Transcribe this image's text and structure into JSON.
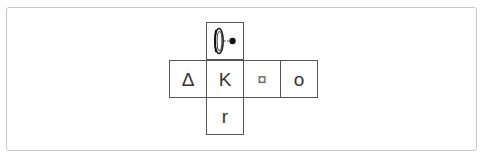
{
  "diagram": {
    "type": "cube-net",
    "cell_size_px": 38,
    "colors": {
      "frame_border": "#c8c8c8",
      "cell_border": "#555555",
      "glyph": "#333333"
    },
    "cells": [
      {
        "id": "top",
        "row": 0,
        "col": 1,
        "kind": "icon",
        "icon": "ring-with-dot-icon",
        "label": ""
      },
      {
        "id": "left",
        "row": 1,
        "col": 0,
        "kind": "text",
        "label": "Δ"
      },
      {
        "id": "center",
        "row": 1,
        "col": 1,
        "kind": "text",
        "label": "K"
      },
      {
        "id": "right",
        "row": 1,
        "col": 2,
        "kind": "text",
        "label": "¤"
      },
      {
        "id": "far-right",
        "row": 1,
        "col": 3,
        "kind": "text",
        "label": "o"
      },
      {
        "id": "bottom",
        "row": 2,
        "col": 1,
        "kind": "text",
        "label": "r"
      }
    ]
  }
}
